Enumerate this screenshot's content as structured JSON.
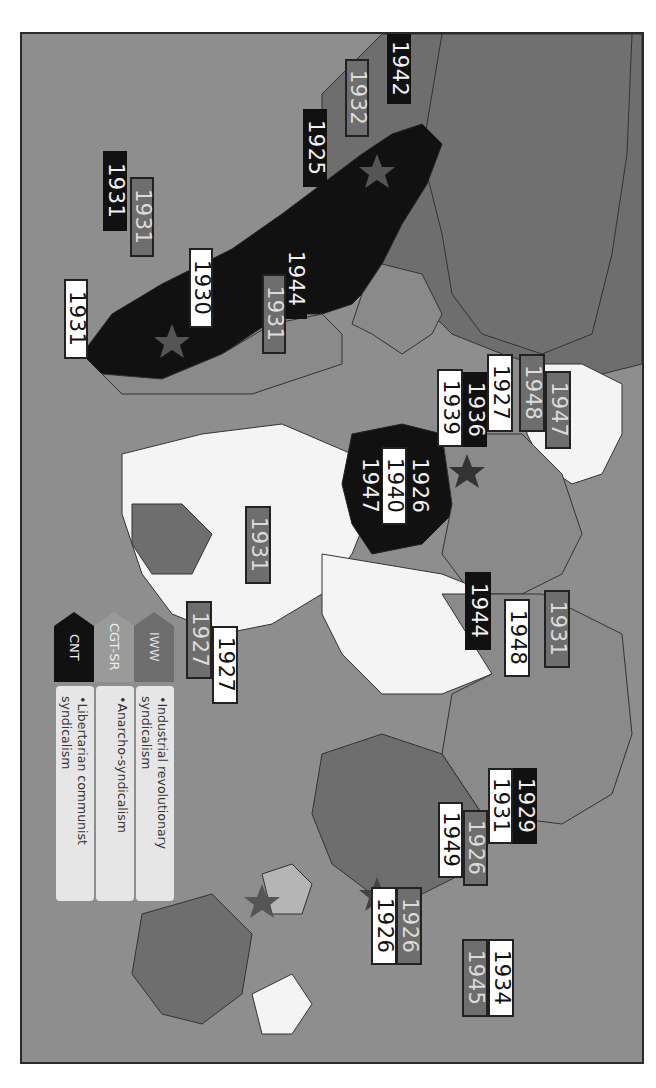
{
  "map": {
    "orientation": "rotated 90 degrees clockwise",
    "colors": {
      "ocean": "#8e8e8e",
      "land_neutral": "#8a8a8a",
      "land_white": "#f4f4f4",
      "iww": "#6e6e6e",
      "cgt_sr": "#9a9a9a",
      "cnt": "#111111"
    }
  },
  "legend": {
    "items": [
      {
        "abbr": "IWW",
        "description": "Industrial revolutionary syndicalism"
      },
      {
        "abbr": "CGT-SR",
        "description": "Anarcho-syndicalism"
      },
      {
        "abbr": "CNT",
        "description": "Libertarian communist syndicalism"
      }
    ]
  },
  "labels": {
    "americas": {
      "north_1942": "1942",
      "north_1932": "1932",
      "north_1925": "1925",
      "south_1931_black": "1931",
      "south_1931_grey": "1931",
      "south_1931_white": "1931",
      "south_1930": "1930",
      "central_1944": "1944",
      "central_1931": "1931"
    },
    "europe": {
      "e_1927": "1927",
      "e_1948_grey": "1948",
      "e_1947_grey": "1947",
      "e_1939": "1939",
      "e_1936": "1936",
      "e_1926": "1926",
      "e_1940": "1940",
      "e_1947_black": "1947",
      "e_1944": "1944",
      "e_1948_white": "1948",
      "e_1931": "1931"
    },
    "africa": {
      "af_1931": "1931",
      "af_1927_grey": "1927",
      "af_1927_white": "1927"
    },
    "asia": {
      "as_1929": "1929",
      "as_1931": "1931",
      "as_1926_grey": "1926",
      "as_1949": "1949",
      "as_1926_grey_b": "1926",
      "as_1926_white": "1926",
      "as_1934": "1934",
      "as_1945": "1945"
    }
  }
}
